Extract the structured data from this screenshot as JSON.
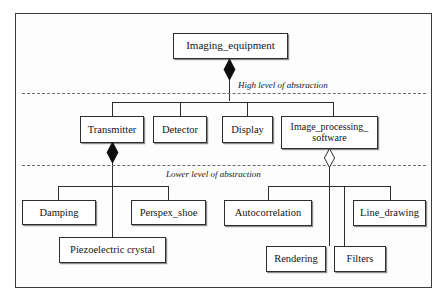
{
  "diagram": {
    "type": "uml-composition-hierarchy",
    "colors": {
      "background": "#ffffff",
      "frame_border": "#3b3b3b",
      "node_border": "#2e2e2e",
      "connector": "#2e2e2e",
      "divider": "#6e6e6e",
      "text": "#141414"
    },
    "bands": [
      {
        "label": "High level of abstraction"
      },
      {
        "label": "Lower level of abstraction"
      }
    ],
    "nodes": [
      {
        "id": "imaging_equipment",
        "label": "Imaging_equipment"
      },
      {
        "id": "transmitter",
        "label": "Transmitter"
      },
      {
        "id": "detector",
        "label": "Detector"
      },
      {
        "id": "display",
        "label": "Display"
      },
      {
        "id": "image_processing_software",
        "label": "Image_processing_\nsoftware"
      },
      {
        "id": "damping",
        "label": "Damping"
      },
      {
        "id": "perspex_shoe",
        "label": "Perspex_shoe"
      },
      {
        "id": "piezoelectric_crystal",
        "label": "Piezoelectric crystal"
      },
      {
        "id": "autocorrelation",
        "label": "Autocorrelation"
      },
      {
        "id": "line_drawing",
        "label": "Line_drawing"
      },
      {
        "id": "rendering",
        "label": "Rendering"
      },
      {
        "id": "filters",
        "label": "Filters"
      }
    ],
    "relationships": [
      {
        "from": "imaging_equipment",
        "to": "transmitter",
        "kind": "composition",
        "marker": "filled-diamond"
      },
      {
        "from": "imaging_equipment",
        "to": "detector",
        "kind": "composition",
        "marker": "filled-diamond"
      },
      {
        "from": "imaging_equipment",
        "to": "display",
        "kind": "composition",
        "marker": "filled-diamond"
      },
      {
        "from": "imaging_equipment",
        "to": "image_processing_software",
        "kind": "composition",
        "marker": "filled-diamond"
      },
      {
        "from": "transmitter",
        "to": "damping",
        "kind": "composition",
        "marker": "filled-diamond"
      },
      {
        "from": "transmitter",
        "to": "perspex_shoe",
        "kind": "composition",
        "marker": "filled-diamond"
      },
      {
        "from": "transmitter",
        "to": "piezoelectric_crystal",
        "kind": "composition",
        "marker": "filled-diamond"
      },
      {
        "from": "image_processing_software",
        "to": "autocorrelation",
        "kind": "aggregation",
        "marker": "hollow-diamond"
      },
      {
        "from": "image_processing_software",
        "to": "rendering",
        "kind": "aggregation",
        "marker": "hollow-diamond"
      },
      {
        "from": "image_processing_software",
        "to": "filters",
        "kind": "aggregation",
        "marker": "hollow-diamond"
      },
      {
        "from": "image_processing_software",
        "to": "line_drawing",
        "kind": "aggregation",
        "marker": "hollow-diamond"
      }
    ]
  }
}
